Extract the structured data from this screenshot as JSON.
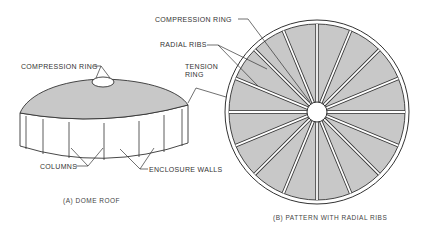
{
  "figure_a": {
    "caption": "(A) DOME ROOF",
    "labels": {
      "compression_ring": "COMPRESSION RING",
      "columns": "COLUMNS",
      "enclosure_walls": "ENCLOSURE WALLS"
    }
  },
  "figure_b": {
    "caption": "(B) PATTERN WITH RADIAL RIBS",
    "labels": {
      "compression_ring": "COMPRESSION RING",
      "radial_ribs": "RADIAL RIBS",
      "tension_ring_line1": "TENSION",
      "tension_ring_line2": "RING"
    },
    "rib_count": 16
  },
  "colors": {
    "fill": "#c8c8c8",
    "line": "#333333",
    "background": "#ffffff"
  }
}
